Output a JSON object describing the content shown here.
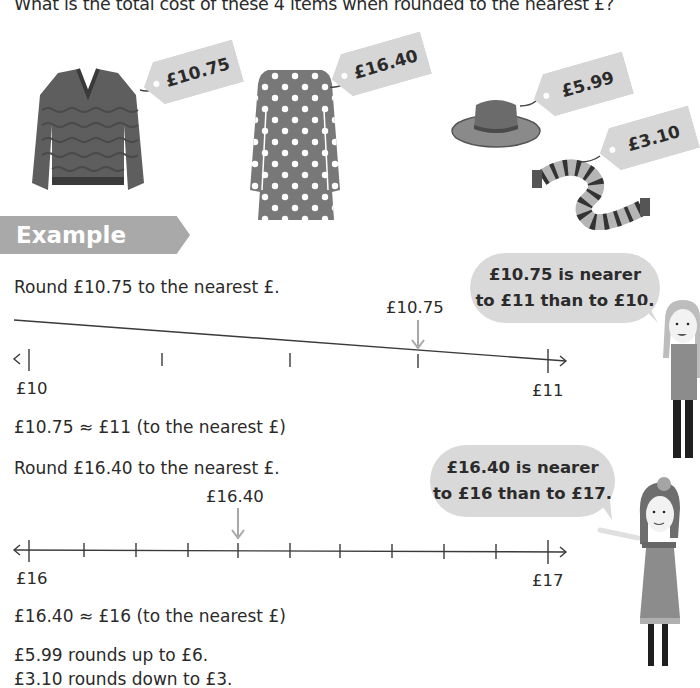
{
  "question": "What is the total cost of these 4 items when rounded to the nearest £?",
  "items": [
    {
      "name": "jumper",
      "price": "£10.75"
    },
    {
      "name": "dress",
      "price": "£16.40"
    },
    {
      "name": "hat",
      "price": "£5.99"
    },
    {
      "name": "scarf",
      "price": "£3.10"
    }
  ],
  "example": {
    "heading": "Example",
    "part1": {
      "instruction": "Round £10.75 to the nearest £.",
      "marker_label": "£10.75",
      "start_label": "£10",
      "end_label": "£11",
      "result": "£10.75 ≈ £11 (to the nearest £)",
      "bubble_line1": "£10.75 is nearer",
      "bubble_line2": "to £11 than to £10."
    },
    "part2": {
      "instruction": "Round £16.40 to the nearest £.",
      "marker_label": "£16.40",
      "start_label": "£16",
      "end_label": "£17",
      "result": "£16.40 ≈ £16 (to the nearest £)",
      "bubble_line1": "£16.40 is nearer",
      "bubble_line2": "to £16 than to £17."
    },
    "note1": "£5.99 rounds up to £6.",
    "note2": "£3.10 rounds down to £3."
  },
  "colors": {
    "tag": "#d6d6d6",
    "band": "#a9a9a9",
    "bubble": "#d9d9d9",
    "arrow": "#a8a8a8",
    "text": "#2a2a2a"
  }
}
